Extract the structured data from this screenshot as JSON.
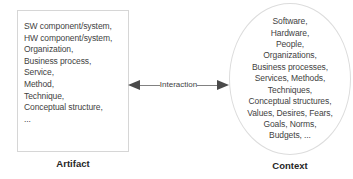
{
  "diagram": {
    "artifact": {
      "label": "Artifact",
      "items": [
        "SW component/system,",
        "HW component/system,",
        "Organization,",
        "Business process,",
        "Service,",
        "Method,",
        "Technique,",
        "Conceptual structure,",
        "..."
      ]
    },
    "context": {
      "label": "Context",
      "items": [
        "Software,",
        "Hardware,",
        "People,",
        "Organizations,",
        "Business processes,",
        "Services, Methods,",
        "Techniques,",
        "Conceptual structures,",
        "Values, Desires, Fears,",
        "Goals, Norms,",
        "Budgets, ..."
      ]
    },
    "interaction": {
      "label": "Interaction"
    },
    "colors": {
      "shape_text": "#3f3f3f",
      "shape_border": "#d6d6d6",
      "arrow": "#4a4a4a",
      "caption": "#262626"
    }
  }
}
